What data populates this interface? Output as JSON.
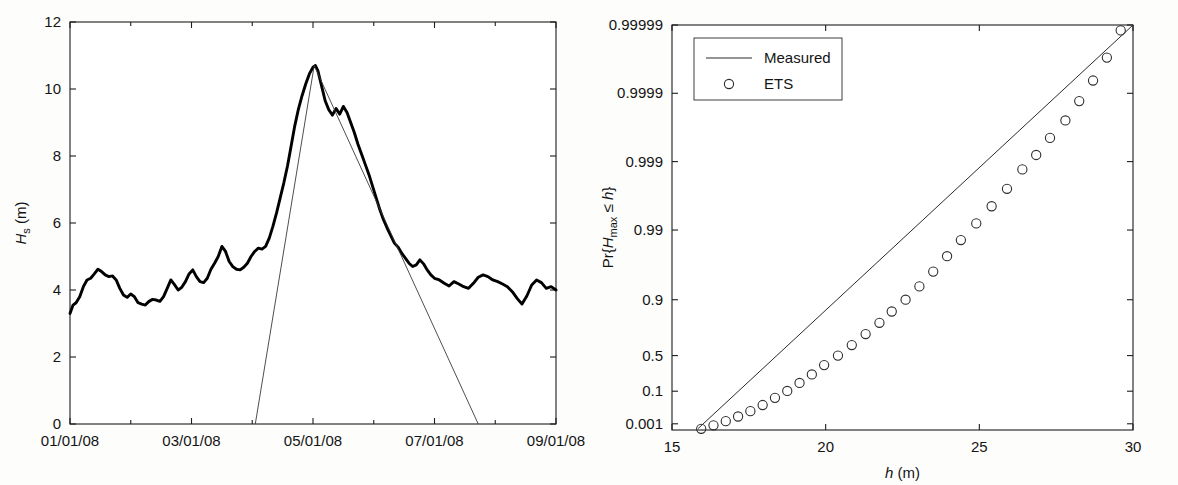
{
  "figure": {
    "background_color": "#fdfdfc",
    "line_color": "#000000",
    "marker_color": "#2d2d2d"
  },
  "chart_data": [
    {
      "type": "line",
      "panel": "left",
      "title": "",
      "xlabel": "",
      "ylabel": "H_s (m)",
      "ylabel_parts": {
        "main": "H",
        "sub": "s",
        "unit": " (m)"
      },
      "xlim": [
        0,
        8
      ],
      "ylim": [
        0,
        12
      ],
      "yticks": [
        0,
        2,
        4,
        6,
        8,
        10,
        12
      ],
      "yticklabels": [
        "0",
        "2",
        "4",
        "6",
        "8",
        "10",
        "12"
      ],
      "xticks": [
        0,
        2,
        4,
        6,
        8
      ],
      "xticklabels": [
        "01/01/08",
        "03/01/08",
        "05/01/08",
        "07/01/08",
        "09/01/08"
      ],
      "xminorticks": [
        1,
        3,
        5,
        7
      ],
      "grid": false,
      "legend": "none",
      "series": [
        {
          "name": "Measured significant wave height",
          "style": "thick-line",
          "x": [
            0.0,
            0.05,
            0.1,
            0.16,
            0.22,
            0.28,
            0.34,
            0.4,
            0.46,
            0.52,
            0.58,
            0.64,
            0.7,
            0.76,
            0.82,
            0.88,
            0.94,
            1.0,
            1.06,
            1.12,
            1.18,
            1.24,
            1.3,
            1.36,
            1.42,
            1.48,
            1.54,
            1.6,
            1.66,
            1.72,
            1.78,
            1.84,
            1.9,
            1.96,
            2.02,
            2.08,
            2.14,
            2.2,
            2.26,
            2.32,
            2.38,
            2.44,
            2.5,
            2.56,
            2.62,
            2.68,
            2.74,
            2.8,
            2.86,
            2.92,
            2.98,
            3.04,
            3.1,
            3.16,
            3.22,
            3.28,
            3.34,
            3.4,
            3.46,
            3.52,
            3.58,
            3.64,
            3.7,
            3.76,
            3.82,
            3.88,
            3.94,
            4.0,
            4.04,
            4.08,
            4.12,
            4.16,
            4.2,
            4.26,
            4.32,
            4.38,
            4.44,
            4.5,
            4.56,
            4.62,
            4.68,
            4.74,
            4.8,
            4.86,
            4.92,
            4.98,
            5.04,
            5.1,
            5.16,
            5.22,
            5.28,
            5.34,
            5.4,
            5.46,
            5.52,
            5.58,
            5.64,
            5.7,
            5.76,
            5.82,
            5.88,
            5.94,
            6.0,
            6.08,
            6.16,
            6.24,
            6.32,
            6.4,
            6.48,
            6.56,
            6.64,
            6.72,
            6.8,
            6.88,
            6.96,
            7.04,
            7.12,
            7.2,
            7.28,
            7.36,
            7.44,
            7.52,
            7.6,
            7.68,
            7.76,
            7.84,
            7.92,
            8.0
          ],
          "y": [
            3.3,
            3.55,
            3.62,
            3.8,
            4.1,
            4.3,
            4.35,
            4.48,
            4.62,
            4.55,
            4.45,
            4.4,
            4.42,
            4.3,
            4.05,
            3.85,
            3.78,
            3.88,
            3.8,
            3.62,
            3.58,
            3.55,
            3.66,
            3.72,
            3.7,
            3.66,
            3.8,
            4.05,
            4.3,
            4.16,
            4.0,
            4.08,
            4.25,
            4.48,
            4.6,
            4.4,
            4.25,
            4.22,
            4.35,
            4.62,
            4.8,
            5.0,
            5.3,
            5.15,
            4.85,
            4.7,
            4.62,
            4.6,
            4.68,
            4.8,
            5.0,
            5.15,
            5.25,
            5.22,
            5.3,
            5.55,
            5.9,
            6.3,
            6.75,
            7.2,
            7.7,
            8.3,
            8.9,
            9.4,
            9.8,
            10.15,
            10.45,
            10.65,
            10.7,
            10.55,
            10.25,
            9.95,
            9.65,
            9.38,
            9.22,
            9.42,
            9.25,
            9.48,
            9.3,
            9.0,
            8.7,
            8.35,
            8.05,
            7.75,
            7.45,
            7.1,
            6.75,
            6.4,
            6.1,
            5.85,
            5.62,
            5.4,
            5.28,
            5.1,
            4.95,
            4.8,
            4.7,
            4.75,
            4.9,
            4.78,
            4.6,
            4.45,
            4.35,
            4.3,
            4.2,
            4.12,
            4.25,
            4.18,
            4.1,
            4.05,
            4.2,
            4.38,
            4.45,
            4.4,
            4.3,
            4.25,
            4.18,
            4.1,
            3.95,
            3.75,
            3.58,
            3.82,
            4.15,
            4.3,
            4.22,
            4.05,
            4.1,
            4.0,
            3.95,
            3.92,
            4.0,
            4.02
          ]
        },
        {
          "name": "Equivalent triangular storm",
          "style": "thin-line",
          "x": [
            3.05,
            4.02,
            6.72
          ],
          "y": [
            0.0,
            10.7,
            0.0
          ]
        }
      ]
    },
    {
      "type": "scatter",
      "panel": "right",
      "title": "",
      "xlabel": "h (m)",
      "xlabel_parts": {
        "main": "h",
        "unit": " (m)"
      },
      "ylabel": "Pr{H_max ≤ h}",
      "ylabel_parts": {
        "prefix": "Pr{",
        "main": "H",
        "sub": "max",
        "mid": " ≤ ",
        "var": "h",
        "suffix": "}"
      },
      "xlim": [
        15,
        30
      ],
      "xticks": [
        15,
        20,
        25,
        30
      ],
      "xticklabels": [
        "15",
        "20",
        "25",
        "30"
      ],
      "yscale": "gumbel-probability",
      "yticks": [
        0.001,
        0.1,
        0.5,
        0.9,
        0.99,
        0.999,
        0.9999,
        0.99999
      ],
      "yticklabels": [
        "0.001",
        "0.1",
        "0.5",
        "0.9",
        "0.99",
        "0.999",
        "0.9999",
        "0.99999"
      ],
      "ylim": [
        0.0002,
        0.99999
      ],
      "grid": false,
      "legend": {
        "position": "top-left",
        "entries": [
          {
            "label": "Measured",
            "style": "line"
          },
          {
            "label": "ETS",
            "style": "circle"
          }
        ]
      },
      "series": [
        {
          "name": "Measured",
          "style": "line",
          "x": [
            15.85,
            30.0
          ],
          "y": [
            0.0003,
            0.99999
          ]
        },
        {
          "name": "ETS",
          "style": "circle-markers",
          "x": [
            15.95,
            16.35,
            16.75,
            17.15,
            17.55,
            17.95,
            18.35,
            18.75,
            19.15,
            19.55,
            19.95,
            20.4,
            20.85,
            21.3,
            21.75,
            22.15,
            22.6,
            23.05,
            23.5,
            23.95,
            24.4,
            24.9,
            25.4,
            25.9,
            26.4,
            26.85,
            27.3,
            27.8,
            28.25,
            28.7,
            29.15,
            29.6
          ],
          "y": [
            0.00028,
            0.0007,
            0.0018,
            0.0045,
            0.011,
            0.0255,
            0.056,
            0.102,
            0.175,
            0.27,
            0.385,
            0.5,
            0.615,
            0.715,
            0.795,
            0.855,
            0.9,
            0.935,
            0.96,
            0.976,
            0.986,
            0.992,
            0.9955,
            0.9975,
            0.9987,
            0.9992,
            0.99955,
            0.99975,
            0.99987,
            0.999935,
            0.99997,
            0.999988
          ]
        }
      ]
    }
  ]
}
